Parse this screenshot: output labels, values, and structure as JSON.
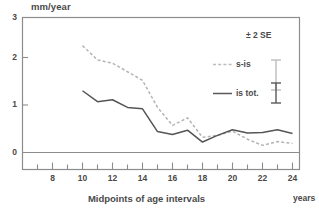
{
  "chart_data": {
    "type": "line",
    "title": "",
    "xlabel": "Midpoints of age intervals",
    "xunits": "years",
    "ylabel": "mm/year",
    "xlim": [
      6.6,
      25.0
    ],
    "ylim": [
      -0.55,
      3.0
    ],
    "grid": false,
    "legend_position": "top-right",
    "legend_header": "± 2 SE",
    "xticks_major": [
      8,
      10,
      12,
      14,
      16,
      18,
      20,
      22,
      24
    ],
    "xticks_major_labels": [
      "8",
      "10",
      "12",
      "14",
      "16",
      "18",
      "20",
      "22",
      "24"
    ],
    "xticks_minor": [
      7,
      9,
      11,
      13,
      15,
      17,
      19,
      21,
      23,
      25
    ],
    "yticks": [
      0,
      1,
      2,
      3
    ],
    "ytick_labels": [
      "0",
      "1",
      "2",
      "3"
    ],
    "x": [
      10,
      11,
      12,
      13,
      14,
      15,
      16,
      17,
      18,
      19,
      20,
      21,
      22,
      23,
      24
    ],
    "series": [
      {
        "name": "s-is",
        "style": "dashed",
        "color": "#b4b4b4",
        "values": [
          2.25,
          1.95,
          1.88,
          1.7,
          1.52,
          0.95,
          0.57,
          0.73,
          0.32,
          0.36,
          0.45,
          0.28,
          0.15,
          0.23,
          0.19
        ],
        "error_bar": {
          "center": 1.97,
          "half_width": 0.3,
          "x_pos": 22.15
        }
      },
      {
        "name": "is tot.",
        "style": "solid",
        "color": "#555555",
        "values": [
          1.3,
          1.07,
          1.11,
          0.95,
          0.92,
          0.44,
          0.38,
          0.47,
          0.22,
          0.36,
          0.48,
          0.41,
          0.42,
          0.48,
          0.4
        ],
        "error_bar": {
          "center": 1.33,
          "half_width": 0.21,
          "x_pos": 22.15
        }
      }
    ]
  },
  "legend": {
    "header": "± 2 SE",
    "items": [
      {
        "label": "s-is",
        "swatch": "dashed-line-swatch"
      },
      {
        "label": "is tot.",
        "swatch": "solid-line-swatch"
      }
    ]
  },
  "axes": {
    "y_axis_caption": "mm/year",
    "x_axis_caption": "Midpoints of age intervals",
    "x_axis_units": "years"
  }
}
